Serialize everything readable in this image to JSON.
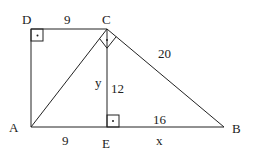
{
  "diagram": {
    "points": {
      "D": {
        "label": "D",
        "x": 31,
        "y": 29
      },
      "C": {
        "label": "C",
        "x": 107,
        "y": 29
      },
      "A": {
        "label": "A",
        "x": 31,
        "y": 127
      },
      "E": {
        "label": "E",
        "x": 107,
        "y": 127
      },
      "B": {
        "label": "B",
        "x": 224,
        "y": 127
      }
    },
    "segment_labels": {
      "DC": "9",
      "CB": "20",
      "CE_y": "y",
      "CE_12": "12",
      "AE": "9",
      "EB_16": "16",
      "EB_x": "x"
    },
    "right_angles": [
      "D",
      "C",
      "E"
    ],
    "stroke_color": "#222222"
  }
}
